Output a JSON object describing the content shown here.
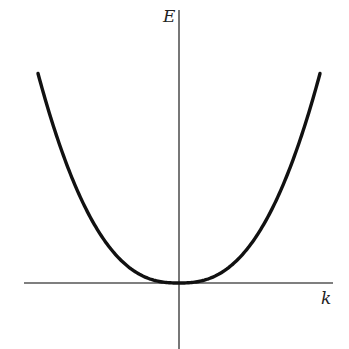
{
  "chart_data": {
    "type": "line",
    "title": "",
    "xlabel": "k",
    "ylabel": "E",
    "grid": false,
    "legend": null,
    "x": [
      -1.0,
      -0.9,
      -0.8,
      -0.7,
      -0.6,
      -0.5,
      -0.4,
      -0.3,
      -0.2,
      -0.1,
      0.0,
      0.1,
      0.2,
      0.3,
      0.4,
      0.5,
      0.6,
      0.7,
      0.8,
      0.9,
      1.0
    ],
    "series": [
      {
        "name": "E(k)",
        "values": [
          1.0,
          0.77,
          0.57,
          0.41,
          0.28,
          0.18,
          0.1,
          0.05,
          0.018,
          0.003,
          0.0,
          0.003,
          0.018,
          0.05,
          0.1,
          0.18,
          0.28,
          0.41,
          0.57,
          0.77,
          1.0
        ]
      }
    ],
    "xlim": [
      -1.1,
      1.1
    ],
    "ylim": [
      -0.32,
      1.3
    ],
    "ticks": "none"
  },
  "labels": {
    "y_axis": "E",
    "x_axis": "k"
  },
  "style": {
    "curve_color": "#111111",
    "axis_color": "#555555",
    "background": "#ffffff"
  },
  "geometry": {
    "origin_px": [
      179,
      283
    ],
    "curve_left_end_px": [
      37,
      74
    ],
    "curve_right_end_px": [
      319,
      73
    ],
    "x_axis_px": [
      24,
      333
    ],
    "y_axis_px": [
      10,
      349
    ],
    "exponent": 2.5
  }
}
